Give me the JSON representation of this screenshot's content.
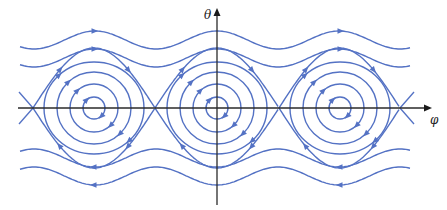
{
  "diagram": {
    "axes": {
      "x_label": "φ",
      "y_label": "θ",
      "origin": [
        217,
        108
      ],
      "x_range_px": [
        18,
        432
      ],
      "y_range_px": [
        8,
        205
      ]
    },
    "colors": {
      "trajectory": "#5472c4",
      "axis": "#2a2a2a",
      "background": "#ffffff"
    },
    "fixed_points": {
      "centers_x": [
        94,
        217,
        340
      ],
      "saddles_x": [
        33,
        155,
        279,
        400
      ],
      "y": 108
    },
    "orbits": {
      "closed_orbit_radii": [
        {
          "rx": 11,
          "ry": 11
        },
        {
          "rx": 24,
          "ry": 24
        },
        {
          "rx": 37,
          "ry": 36
        },
        {
          "rx": 50,
          "ry": 46
        }
      ],
      "direction": "clockwise"
    },
    "running_curves": {
      "upper": [
        {
          "base_y": 40,
          "amplitude": 9,
          "direction": "right"
        },
        {
          "base_y": 58,
          "amplitude": 9,
          "direction": "right"
        }
      ],
      "lower": [
        {
          "base_y": 158,
          "amplitude": 9,
          "direction": "left"
        },
        {
          "base_y": 176,
          "amplitude": 9,
          "direction": "left"
        }
      ],
      "x_start": 20,
      "x_end": 410
    },
    "separatrix": {
      "peak_height": 60,
      "direction_top": "right",
      "direction_bottom": "left"
    }
  }
}
